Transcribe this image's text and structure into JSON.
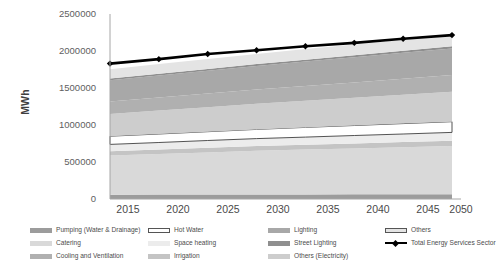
{
  "chart_data": {
    "type": "area",
    "title": "",
    "xlabel": "",
    "ylabel": "MWh",
    "x": [
      2015,
      2020,
      2025,
      2030,
      2035,
      2040,
      2045,
      2050
    ],
    "categories": [
      "2015",
      "2020",
      "2025",
      "2030",
      "2035",
      "2040",
      "2045",
      "2050"
    ],
    "ylim": [
      0,
      2500000
    ],
    "yticks": [
      0,
      500000,
      1000000,
      1500000,
      2000000,
      2500000
    ],
    "ytick_labels": [
      "0",
      "500000",
      "1000000",
      "1500000",
      "2000000",
      "2500000"
    ],
    "grid": false,
    "legend_position": "bottom",
    "stacking_order_bottom_to_top": [
      "Pumping (Water & Drainage)",
      "Catering",
      "Irrigation",
      "Space heating",
      "Hot Water",
      "Others (Electricity)",
      "Cooling and Ventilation",
      "Lighting",
      "Street Lighting",
      "Others"
    ],
    "series": [
      {
        "name": "Pumping (Water & Drainage)",
        "kind": "area",
        "color": "#9c9c9c",
        "values": [
          58000,
          59000,
          60000,
          61000,
          62000,
          63000,
          64000,
          65000
        ]
      },
      {
        "name": "Catering",
        "kind": "area",
        "color": "#d9d9d9",
        "values": [
          530000,
          550000,
          570000,
          590000,
          605000,
          620000,
          635000,
          650000
        ]
      },
      {
        "name": "Irrigation",
        "kind": "area",
        "color": "#c4c4c4",
        "values": [
          58000,
          60000,
          62000,
          64000,
          66000,
          68000,
          70000,
          72000
        ]
      },
      {
        "name": "Space heating",
        "kind": "area",
        "color": "#ececec",
        "values": [
          92000,
          95000,
          98000,
          101000,
          104000,
          107000,
          110000,
          113000
        ]
      },
      {
        "name": "Hot Water",
        "kind": "area",
        "color": "#ffffff",
        "border": "#404040",
        "values": [
          110000,
          115000,
          120000,
          125000,
          130000,
          135000,
          140000,
          145000
        ]
      },
      {
        "name": "Others (Electricity)",
        "kind": "area",
        "color": "#cdcdcd",
        "values": [
          300000,
          315000,
          330000,
          345000,
          360000,
          375000,
          390000,
          405000
        ]
      },
      {
        "name": "Cooling and Ventilation",
        "kind": "area",
        "color": "#b0b0b0",
        "values": [
          168000,
          176000,
          184000,
          192000,
          200000,
          208000,
          216000,
          224000
        ]
      },
      {
        "name": "Lighting",
        "kind": "area",
        "color": "#a8a8a8",
        "values": [
          290000,
          300000,
          310000,
          320000,
          330000,
          340000,
          350000,
          360000
        ]
      },
      {
        "name": "Street Lighting",
        "kind": "area",
        "color": "#8f8f8f",
        "values": [
          22000,
          23000,
          24000,
          25000,
          26000,
          27000,
          28000,
          29000
        ]
      },
      {
        "name": "Others",
        "kind": "area",
        "color": "#e4e4e4",
        "values": [
          126000,
          130000,
          134000,
          138000,
          142000,
          146000,
          150000,
          154000
        ]
      },
      {
        "name": "Total Energy Services Sector",
        "kind": "line",
        "color": "#000000",
        "marker": "diamond",
        "values": [
          1830000,
          1890000,
          1960000,
          2010000,
          2065000,
          2110000,
          2165000,
          2215000
        ]
      }
    ]
  },
  "axis": {
    "y_label": "MWh",
    "y_ticks": [
      "2500000",
      "2000000",
      "1500000",
      "1000000",
      "500000",
      "0"
    ],
    "x_ticks": [
      "2015",
      "2020",
      "2025",
      "2030",
      "2035",
      "2040",
      "2045",
      "2050"
    ]
  },
  "legend": {
    "items": [
      {
        "label": "Pumping (Water & Drainage)",
        "color": "#9c9c9c",
        "type": "swatch"
      },
      {
        "label": "Catering",
        "color": "#d9d9d9",
        "type": "swatch"
      },
      {
        "label": "Cooling and Ventilation",
        "color": "#b0b0b0",
        "type": "swatch"
      },
      {
        "label": "Hot Water",
        "color": "#ffffff",
        "type": "swatch-outlined"
      },
      {
        "label": "Space heating",
        "color": "#ececec",
        "type": "swatch"
      },
      {
        "label": "Irrigation",
        "color": "#c4c4c4",
        "type": "swatch"
      },
      {
        "label": "Lighting",
        "color": "#a8a8a8",
        "type": "swatch"
      },
      {
        "label": "Street Lighting",
        "color": "#8f8f8f",
        "type": "swatch"
      },
      {
        "label": "Others (Electricity)",
        "color": "#cdcdcd",
        "type": "swatch"
      },
      {
        "label": "Others",
        "color": "#e4e4e4",
        "type": "swatch-outlined"
      },
      {
        "label": "Total Energy Services Sector",
        "color": "#000000",
        "type": "line-marker"
      }
    ]
  }
}
